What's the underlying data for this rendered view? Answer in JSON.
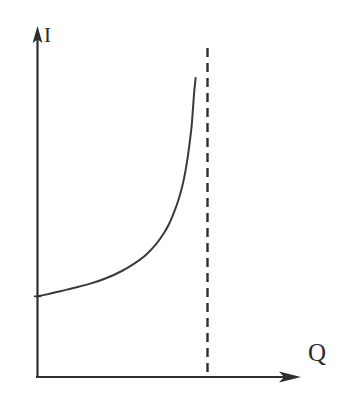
{
  "figure": {
    "title": "",
    "background_color": "#ffffff",
    "line_color": "#3a3a3a",
    "axis_color": "#2f2f2f"
  },
  "axes": {
    "y": {
      "label": "I",
      "label_name": "current",
      "arrow": "up"
    },
    "x": {
      "label": "Q",
      "label_name": "charge",
      "arrow": "right"
    }
  },
  "annotations": {
    "asymptote": {
      "label": "",
      "style": "dashed-vertical"
    }
  },
  "chart_data": {
    "type": "line",
    "title": "",
    "xlabel": "Q",
    "ylabel": "I",
    "xlim": [
      0,
      10
    ],
    "ylim": [
      0,
      10
    ],
    "grid": false,
    "legend": null,
    "axis_style": "arrowed-lines",
    "series": [
      {
        "name": "I vs Q",
        "description": "Monotonically increasing curve rising slowly then asymptotically vertical near Q = 5.9",
        "x": [
          0.0,
          0.4,
          0.9,
          1.4,
          2.0,
          2.6,
          3.2,
          3.7,
          4.1,
          4.5,
          4.8,
          5.0,
          5.2,
          5.35,
          5.5,
          5.6,
          5.7,
          5.78,
          5.85,
          5.9,
          5.95,
          6.0
        ],
        "y": [
          2.55,
          2.62,
          2.72,
          2.82,
          2.95,
          3.12,
          3.35,
          3.6,
          3.85,
          4.2,
          4.55,
          4.85,
          5.25,
          5.6,
          6.05,
          6.45,
          6.95,
          7.45,
          7.95,
          8.5,
          9.05,
          9.45
        ]
      }
    ],
    "asymptotes": [
      {
        "orientation": "vertical",
        "x": 6.45,
        "style": "dashed",
        "from_y": 0,
        "to_y": 10.4
      }
    ]
  }
}
